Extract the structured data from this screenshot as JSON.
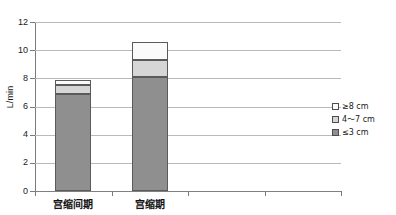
{
  "chart_data": {
    "type": "bar",
    "subtype": "stacked-bar",
    "title": "",
    "xlabel": "",
    "ylabel": "L/min",
    "ylim": [
      0,
      12
    ],
    "yticks": [
      0,
      2,
      4,
      6,
      8,
      10,
      12
    ],
    "ytick_labels": [
      "0",
      "2",
      "4",
      "6",
      "8",
      "10",
      "12"
    ],
    "grid": true,
    "grid_axis": "y",
    "legend_position": "right",
    "categories": [
      "宫缩间期",
      "宫缩期"
    ],
    "category_slots": 4,
    "series": [
      {
        "name": "≤ 3 cm",
        "color": "#8f8f8f",
        "values": [
          6.9,
          8.1
        ]
      },
      {
        "name": "4～7 cm",
        "color": "#d6d6d6",
        "values": [
          0.65,
          1.2
        ]
      },
      {
        "name": "≥ 8 cm",
        "color": "#fbfbfb",
        "values": [
          0.35,
          1.25
        ]
      }
    ],
    "totals": [
      7.9,
      10.55
    ],
    "legend_order_top_to_bottom": [
      "≥ 8 cm",
      "4～7 cm",
      "≤ 3 cm"
    ]
  },
  "axes": {
    "y_title": "L/min",
    "y_ticks": [
      {
        "value": 12,
        "label": "12"
      },
      {
        "value": 10,
        "label": "10"
      },
      {
        "value": 8,
        "label": "8"
      },
      {
        "value": 6,
        "label": "6"
      },
      {
        "value": 4,
        "label": "4"
      },
      {
        "value": 2,
        "label": "2"
      },
      {
        "value": 0,
        "label": "0"
      }
    ],
    "x_categories": [
      {
        "index": 0,
        "label": "宫缩间期"
      },
      {
        "index": 1,
        "label": "宫缩期"
      }
    ]
  },
  "legend": {
    "items": [
      {
        "label": "≥8 cm",
        "color": "#fbfbfb"
      },
      {
        "label": "4～7 cm",
        "color": "#d6d6d6"
      },
      {
        "label": "≤3 cm",
        "color": "#8f8f8f"
      }
    ]
  },
  "colors": {
    "segment_small": "#8f8f8f",
    "segment_medium": "#d6d6d6",
    "segment_large": "#fbfbfb",
    "gridline": "#b9b9b9",
    "axis": "#7a7a7a",
    "text": "#1a1a1a",
    "background": "#ffffff"
  }
}
